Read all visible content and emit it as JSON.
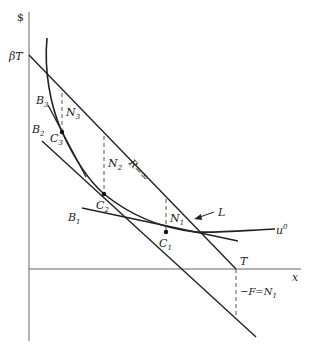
{
  "axes": {
    "y_label": "$",
    "x_label": "x",
    "y_intercept_label": "βT",
    "x_intercept_label": "T"
  },
  "lines": {
    "budget_line_label": "R=∞",
    "arrow_label": "L",
    "utility_curve_label": "u",
    "utility_curve_sup": "0",
    "bottom_label_prefix": "−F=N",
    "bottom_label_sub": "1"
  },
  "points": [
    {
      "id": "C1",
      "base": "C",
      "sub": "1"
    },
    {
      "id": "C2",
      "base": "C",
      "sub": "2"
    },
    {
      "id": "C3",
      "base": "C",
      "sub": "3"
    }
  ],
  "tangents": [
    {
      "id": "B1",
      "base": "B",
      "sub": "1"
    },
    {
      "id": "B2",
      "base": "B",
      "sub": "2"
    },
    {
      "id": "B3",
      "base": "B",
      "sub": "3"
    }
  ],
  "gaps": [
    {
      "id": "N1",
      "base": "N",
      "sub": "1"
    },
    {
      "id": "N2",
      "base": "N",
      "sub": "2"
    },
    {
      "id": "N3",
      "base": "N",
      "sub": "3"
    }
  ],
  "colors": {
    "ink": "#222222",
    "dash": "#555555"
  }
}
